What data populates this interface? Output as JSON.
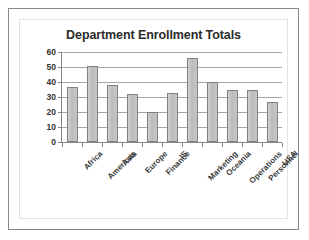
{
  "chart_data": {
    "type": "bar",
    "title": "Department Enrollment Totals",
    "xlabel": "",
    "ylabel": "",
    "categories": [
      "Africa",
      "Americas",
      "Asia",
      "Europe",
      "Finance",
      "IS",
      "Marketing",
      "Oceania",
      "Operations",
      "Personnel",
      "USA"
    ],
    "values": [
      37,
      51,
      38,
      32,
      20,
      33,
      56,
      40,
      35,
      35,
      27
    ],
    "ylim": [
      0,
      60
    ],
    "ytick_labels": [
      "60",
      "50",
      "40",
      "30",
      "20",
      "10",
      "0"
    ],
    "ytick_values": [
      60,
      50,
      40,
      30,
      20,
      10,
      0
    ],
    "grid": true,
    "legend": false,
    "bar_color": "#bfbfbf",
    "bar_border_color": "#808080",
    "gridline_color": "#a6a6a6",
    "title_color": "#2b2b2b",
    "axis_text_color": "#333333",
    "background_color": "#ffffff",
    "frame_border_color": "#8a8a8a"
  }
}
